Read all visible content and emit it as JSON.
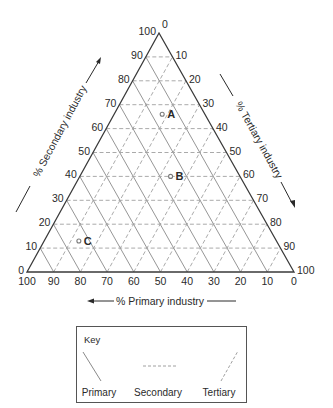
{
  "diagram": {
    "type": "ternary",
    "corners": {
      "primary_100": [
        27,
        272
      ],
      "secondary_100": [
        159,
        33
      ],
      "tertiary_100": [
        294,
        272
      ]
    },
    "tick_step": 10,
    "colors": {
      "frame": "#3a3a3a",
      "primary_grid": "#8a8a8a",
      "secondary_grid": "#a0a0a0",
      "tertiary_grid": "#a0a0a0",
      "text": "#2a2a2a",
      "point": "#7a7a7a"
    }
  },
  "axes": {
    "primary": {
      "label": "% Primary industry",
      "ticks": [
        "100",
        "90",
        "80",
        "70",
        "60",
        "50",
        "40",
        "30",
        "20",
        "10",
        "0"
      ]
    },
    "secondary": {
      "label": "% Secondary industry",
      "ticks": [
        "0",
        "10",
        "20",
        "30",
        "40",
        "50",
        "60",
        "70",
        "80",
        "90",
        "100"
      ]
    },
    "tertiary": {
      "label": "% Tertiary industry",
      "ticks": [
        "0",
        "10",
        "20",
        "30",
        "40",
        "50",
        "60",
        "70",
        "80",
        "90",
        "100"
      ]
    }
  },
  "chart_data": {
    "type": "scatter",
    "subtype": "ternary",
    "title": "",
    "axes": [
      "% Primary industry",
      "% Secondary industry",
      "% Tertiary industry"
    ],
    "range": [
      0,
      100
    ],
    "grid": true,
    "points": [
      {
        "label": "A",
        "primary": 16,
        "secondary": 66,
        "tertiary": 18
      },
      {
        "label": "B",
        "primary": 26,
        "secondary": 40,
        "tertiary": 34
      },
      {
        "label": "C",
        "primary": 74,
        "secondary": 13,
        "tertiary": 13
      }
    ],
    "legend": {
      "title": "Key",
      "entries": [
        {
          "label": "Primary",
          "style": "solid"
        },
        {
          "label": "Secondary",
          "style": "dashed horizontal"
        },
        {
          "label": "Tertiary",
          "style": "dashed diagonal"
        }
      ]
    }
  },
  "key": {
    "title": "Key",
    "items": [
      "Primary",
      "Secondary",
      "Tertiary"
    ]
  }
}
